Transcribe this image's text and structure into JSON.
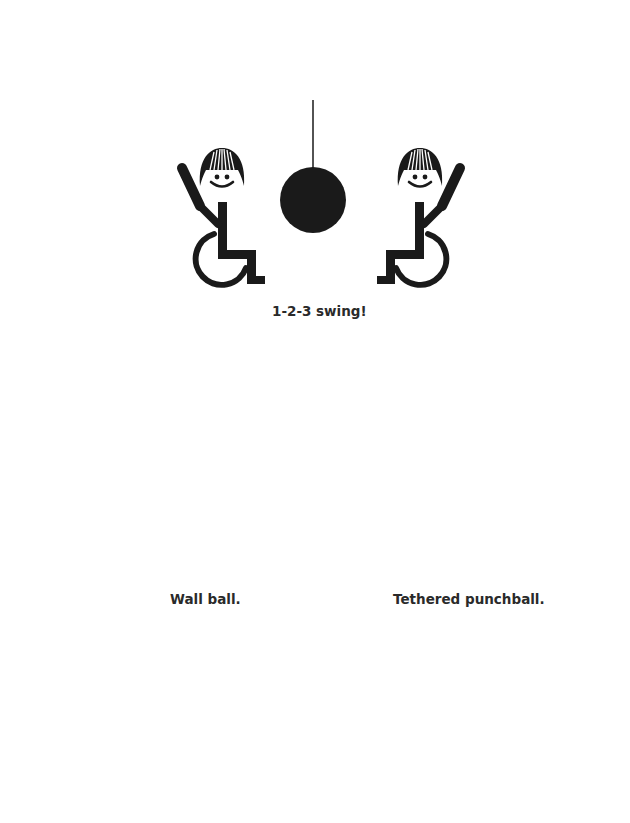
{
  "page": {
    "background": "#ffffff",
    "ink_color": "#1a1a1a",
    "ball_grey": "#808080"
  },
  "illustrations": [
    {
      "id": "swing",
      "caption": "1-2-3 swing!",
      "elements": [
        "figure-wheelchair-left-with-bat",
        "hanging-ball",
        "figure-wheelchair-right-with-bat"
      ]
    },
    {
      "id": "wall-ball",
      "caption": "Wall ball.",
      "elements": [
        "figure-wheelchair-front",
        "figure-wheelchair-back",
        "ball",
        "wall-panel"
      ]
    },
    {
      "id": "tethered-punchball",
      "caption": "Tethered punchball.",
      "elements": [
        "figure-wheelchair-left",
        "tethered-ball",
        "pole-with-net",
        "figure-wheelchair-right"
      ]
    },
    {
      "id": "table-ball",
      "caption": "",
      "elements": [
        "figure-left-with-paddle",
        "grey-ball",
        "table",
        "figure-right-with-paddle"
      ]
    },
    {
      "id": "lying-game",
      "caption": "",
      "elements": [
        "figure-lying-top",
        "figure-lying-bottom",
        "hanging-ball",
        "stacked-blocks"
      ]
    }
  ]
}
